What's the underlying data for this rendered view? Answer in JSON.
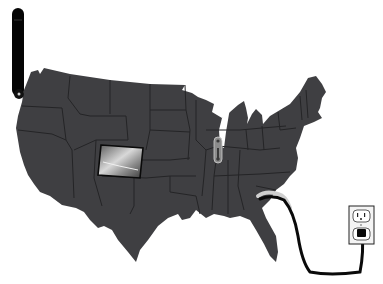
{
  "illustration": {
    "subject": "US map plugged into wall outlet",
    "colors": {
      "background": "#ffffff",
      "map_fill": "#3f3f42",
      "state_border": "#262628",
      "cord": "#0a0a0a",
      "photo_light": "#cfcfcf",
      "outlet_plate": "#f2f2f2"
    },
    "elements": [
      {
        "name": "battery-level-bar",
        "icon": "vertical-bar"
      },
      {
        "name": "colorado-photo-inset",
        "icon": "landscape-photo"
      },
      {
        "name": "illinois-thermometer",
        "icon": "thermometer"
      },
      {
        "name": "power-cord",
        "icon": "cable"
      },
      {
        "name": "wall-outlet",
        "icon": "electrical-outlet"
      }
    ]
  }
}
